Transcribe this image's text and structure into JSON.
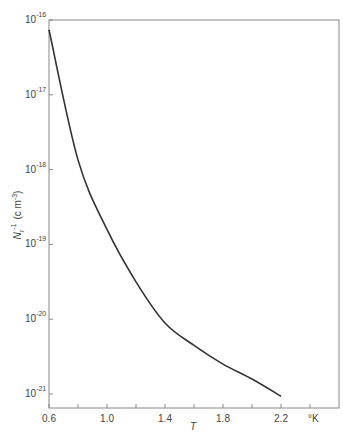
{
  "chart_data": {
    "type": "line",
    "title": "",
    "xlabel": "T",
    "x_unit": "°K",
    "ylabel": "N_r^-1 (cm^-3)",
    "yscale": "log",
    "xlim": [
      0.6,
      2.4
    ],
    "ylim": [
      1e-21,
      1e-16
    ],
    "x_ticks": [
      "0.6",
      "1.0",
      "1.4",
      "1.8",
      "2.2"
    ],
    "y_ticks": [
      {
        "base": "10",
        "exp": "-16"
      },
      {
        "base": "10",
        "exp": "-17"
      },
      {
        "base": "10",
        "exp": "-18"
      },
      {
        "base": "10",
        "exp": "-19"
      },
      {
        "base": "10",
        "exp": "-20"
      },
      {
        "base": "10",
        "exp": "-21"
      }
    ],
    "grid": false,
    "series": [
      {
        "name": "N_r^-1",
        "x": [
          0.6,
          0.8,
          1.0,
          1.2,
          1.4,
          1.6,
          1.8,
          2.0,
          2.2
        ],
        "log10_y": [
          -16.13,
          -17.87,
          -18.8,
          -19.5,
          -20.05,
          -20.35,
          -20.6,
          -20.8,
          -21.03
        ]
      }
    ]
  },
  "labels": {
    "xlabel": "T",
    "unit": "°K",
    "ylabel_main": "N",
    "ylabel_sub": "r",
    "ylabel_sup": "-1",
    "ylabel_units": "(c m",
    "ylabel_units_sup": "-3",
    "ylabel_close": ")"
  }
}
